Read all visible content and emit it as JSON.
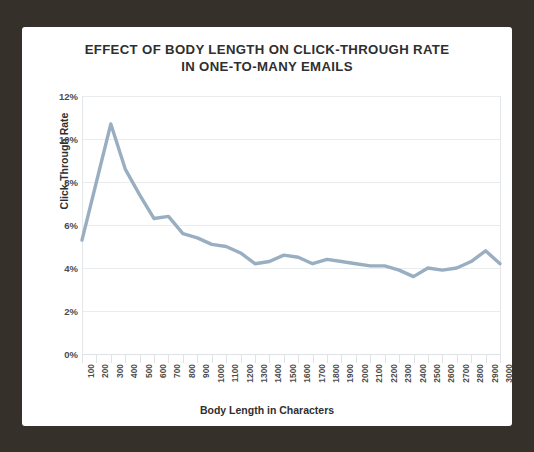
{
  "figure": {
    "title_line1": "EFFECT OF BODY LENGTH ON CLICK-THROUGH RATE",
    "title_line2": "IN ONE-TO-MANY EMAILS",
    "frame_color": "#35302a",
    "panel_color": "#ffffff"
  },
  "chart_data": {
    "type": "line",
    "title": "EFFECT OF BODY LENGTH ON CLICK-THROUGH RATE IN ONE-TO-MANY EMAILS",
    "xlabel": "Body Length in Characters",
    "ylabel": "Click-Through Rate",
    "x": [
      100,
      200,
      300,
      400,
      500,
      600,
      700,
      800,
      900,
      1000,
      1100,
      1200,
      1300,
      1400,
      1500,
      1600,
      1700,
      1800,
      1900,
      2000,
      2100,
      2200,
      2300,
      2400,
      2500,
      2600,
      2700,
      2800,
      2900,
      3000
    ],
    "categories": [
      "100",
      "200",
      "300",
      "400",
      "500",
      "600",
      "700",
      "800",
      "900",
      "1000",
      "1100",
      "1200",
      "1300",
      "1400",
      "1500",
      "1600",
      "1700",
      "1800",
      "1900",
      "2000",
      "2100",
      "2200",
      "2300",
      "2400",
      "2500",
      "2600",
      "2700",
      "2800",
      "2900",
      "3000"
    ],
    "values": [
      5.3,
      8.0,
      10.7,
      8.6,
      7.4,
      6.3,
      6.4,
      5.6,
      5.4,
      5.1,
      5.0,
      4.7,
      4.2,
      4.3,
      4.6,
      4.5,
      4.2,
      4.4,
      4.3,
      4.2,
      4.1,
      4.1,
      3.9,
      3.6,
      4.0,
      3.9,
      4.0,
      4.3,
      4.8,
      4.2
    ],
    "series": [
      {
        "name": "Click-Through Rate",
        "color": "#9aaec1",
        "values": [
          5.3,
          8.0,
          10.7,
          8.6,
          7.4,
          6.3,
          6.4,
          5.6,
          5.4,
          5.1,
          5.0,
          4.7,
          4.2,
          4.3,
          4.6,
          4.5,
          4.2,
          4.4,
          4.3,
          4.2,
          4.1,
          4.1,
          3.9,
          3.6,
          4.0,
          3.9,
          4.0,
          4.3,
          4.8,
          4.2
        ]
      }
    ],
    "ylim": [
      0,
      12
    ],
    "yticks": [
      0,
      2,
      4,
      6,
      8,
      10,
      12
    ],
    "ytick_labels": [
      "0%",
      "2%",
      "4%",
      "6%",
      "8%",
      "10%",
      "12%"
    ],
    "grid": true,
    "grid_axis": "y",
    "legend": false,
    "line_width": 3,
    "line_color": "#9aaec1",
    "grid_color": "#e9ecef",
    "text_color": "#2f2f30"
  }
}
